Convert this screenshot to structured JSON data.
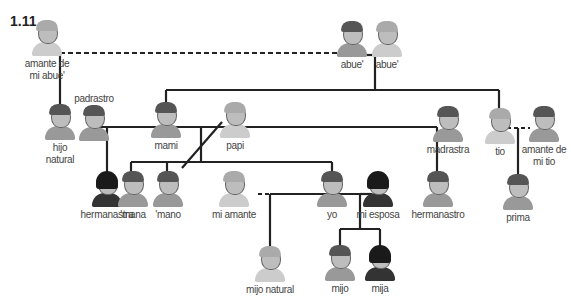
{
  "figure_label": "1.11",
  "people": {
    "amante_abue": "amante de mi abue'",
    "abuelo": "abue'",
    "abuela": "abue'",
    "hijo_natural": "hijo natural",
    "padrastro": "padrastro",
    "mami": "mami",
    "papi": "papi",
    "madrastra": "madrastra",
    "tio": "tio",
    "amante_tio": "amante de mi tio",
    "hermanastra": "hermanastra",
    "mana": "'mana",
    "mano": "'mano",
    "mi_amante": "mi amante",
    "yo": "yo",
    "mi_esposa": "mi esposa",
    "hermanastro": "hermanastro",
    "prima": "prima",
    "mijo_natural": "mijo natural",
    "mijo": "mijo",
    "mija": "mija"
  }
}
